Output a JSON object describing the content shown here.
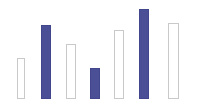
{
  "chart_data": {
    "type": "bar",
    "title": "",
    "subtitle": "",
    "xlabel": "",
    "ylabel": "",
    "categories": [
      "1",
      "2",
      "3",
      "4",
      "5",
      "6",
      "7"
    ],
    "values": [
      41,
      74,
      55,
      31,
      69,
      90,
      76
    ],
    "ylim": [
      0,
      99
    ],
    "grid": false,
    "legend": null,
    "axis_ticks": {
      "x": [],
      "y": []
    },
    "annotations": [],
    "series": [
      {
        "name": "values",
        "values": [
          41,
          74,
          55,
          31,
          69,
          90,
          76
        ]
      }
    ],
    "colors": {
      "filled": "#4b4f96",
      "filled_border": "#42468c",
      "outline_fill": "#ffffff",
      "outline_border": "#c9c9c9",
      "background": "#ffffff"
    },
    "bars": [
      {
        "index": 1,
        "value": 41,
        "style": "outline",
        "x": 17,
        "y": 58,
        "width": 8,
        "height": 41
      },
      {
        "index": 2,
        "value": 74,
        "style": "filled",
        "x": 41,
        "y": 25,
        "width": 10,
        "height": 74
      },
      {
        "index": 3,
        "value": 55,
        "style": "outline",
        "x": 66,
        "y": 44,
        "width": 10,
        "height": 55
      },
      {
        "index": 4,
        "value": 31,
        "style": "filled",
        "x": 90,
        "y": 68,
        "width": 10,
        "height": 31
      },
      {
        "index": 5,
        "value": 69,
        "style": "outline",
        "x": 114,
        "y": 30,
        "width": 10,
        "height": 69
      },
      {
        "index": 6,
        "value": 90,
        "style": "filled",
        "x": 139,
        "y": 9,
        "width": 10,
        "height": 90
      },
      {
        "index": 7,
        "value": 76,
        "style": "outline",
        "x": 168,
        "y": 23,
        "width": 11,
        "height": 76
      }
    ]
  }
}
